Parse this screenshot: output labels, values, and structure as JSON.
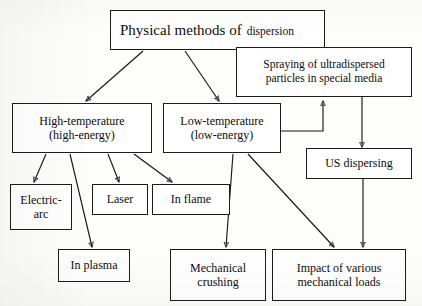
{
  "diagram": {
    "kind": "flowchart",
    "title_text_primary": "Physical methods of",
    "title_text_secondary": "dispersion",
    "nodes": {
      "root": {
        "label": "Physical methods of dispersion"
      },
      "spraying": {
        "label": "Spraying of ultradispersed\nparticles in special media"
      },
      "high_temp": {
        "label": "High-temperature\n(high-energy)"
      },
      "low_temp": {
        "label": "Low-temperature\n(low-energy)"
      },
      "us_dispersing": {
        "label": "US dispersing"
      },
      "electric_arc": {
        "label": "Electric-\narc"
      },
      "laser": {
        "label": "Laser"
      },
      "in_flame": {
        "label": "In flame"
      },
      "in_plasma": {
        "label": "In plasma"
      },
      "mechanical_crushing": {
        "label": "Mechanical\ncrushing"
      },
      "impact_loads": {
        "label": "Impact of various\nmechanical loads"
      }
    },
    "edges": [
      {
        "id": "root-to-high-temp",
        "from": "root",
        "to": "high_temp"
      },
      {
        "id": "root-to-low-temp",
        "from": "root",
        "to": "low_temp"
      },
      {
        "id": "low-temp-to-spraying",
        "from": "low_temp",
        "to": "spraying"
      },
      {
        "id": "spraying-to-us-dispersing",
        "from": "spraying",
        "to": "us_dispersing"
      },
      {
        "id": "high-temp-to-electric-arc",
        "from": "high_temp",
        "to": "electric_arc"
      },
      {
        "id": "high-temp-to-in-plasma",
        "from": "high_temp",
        "to": "in_plasma"
      },
      {
        "id": "high-temp-to-laser",
        "from": "high_temp",
        "to": "laser"
      },
      {
        "id": "high-temp-to-in-flame",
        "from": "high_temp",
        "to": "in_flame"
      },
      {
        "id": "low-temp-to-mechanical-crushing",
        "from": "low_temp",
        "to": "mechanical_crushing"
      },
      {
        "id": "low-temp-to-impact-loads",
        "from": "low_temp",
        "to": "impact_loads"
      },
      {
        "id": "us-dispersing-to-impact-loads",
        "from": "us_dispersing",
        "to": "impact_loads"
      }
    ],
    "colors": {
      "background": "#fdfdfc",
      "box_fill": "#ffffff",
      "stroke": "#1b1b1b",
      "text": "#0d0d0d"
    }
  }
}
